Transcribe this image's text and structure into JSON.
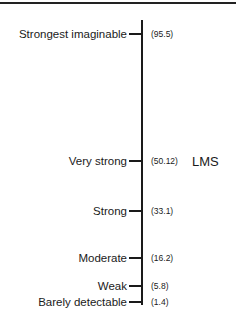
{
  "scale": {
    "name": "LMS",
    "name_anchor_index": 1,
    "items": [
      {
        "label": "Strongest imaginable",
        "value": "(95.5)",
        "y": 33
      },
      {
        "label": "Very strong",
        "value": "(50.12)",
        "y": 160
      },
      {
        "label": "Strong",
        "value": "(33.1)",
        "y": 210
      },
      {
        "label": "Moderate",
        "value": "(16.2)",
        "y": 257
      },
      {
        "label": "Weak",
        "value": "(5.8)",
        "y": 285
      },
      {
        "label": "Barely detectable",
        "value": "(1.4)",
        "y": 301
      }
    ]
  },
  "colors": {
    "line": "#1a1a1a",
    "background": "#ffffff"
  }
}
